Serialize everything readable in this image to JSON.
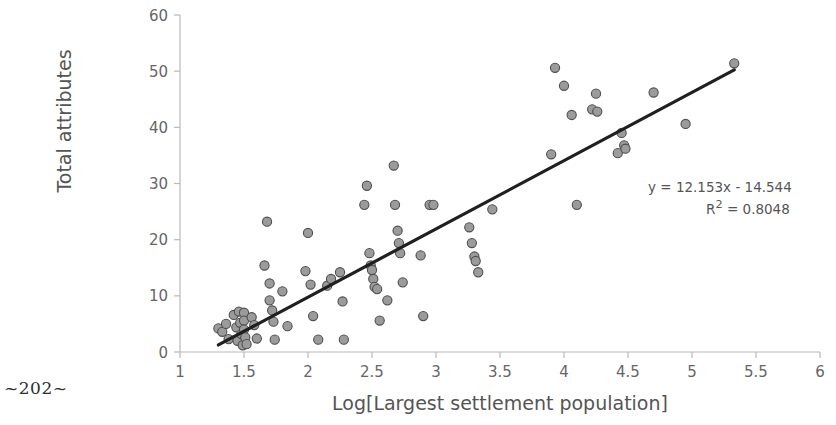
{
  "page": {
    "marker": "~202~"
  },
  "chart_data": {
    "type": "scatter",
    "title": "",
    "xlabel": "Log[Largest settlement population]",
    "ylabel": "Total attributes",
    "xlim": [
      1,
      6
    ],
    "ylim": [
      0,
      60
    ],
    "xticks": [
      1,
      1.5,
      2,
      2.5,
      3,
      3.5,
      4,
      4.5,
      5,
      5.5,
      6
    ],
    "xtick_labels": [
      "1",
      "1.5",
      "2",
      "2.5",
      "3",
      "3.5",
      "4",
      "4.5",
      "5",
      "5.5",
      "6"
    ],
    "yticks": [
      0,
      10,
      20,
      30,
      40,
      50,
      60
    ],
    "ytick_labels": [
      "0",
      "10",
      "20",
      "30",
      "40",
      "50",
      "60"
    ],
    "grid": false,
    "legend": "none",
    "marker_fill": "#9b9b9b",
    "marker_stroke": "#4f4f4f",
    "marker_radius": 4.6,
    "trendline": {
      "slope": 12.153,
      "intercept": -14.544,
      "r_squared": 0.8048,
      "color": "#1f1f1f",
      "width": 3.2,
      "x_start": 1.3,
      "x_end": 5.33,
      "equation_label": "y = 12.153x - 14.544",
      "r2_label_prefix": "R",
      "r2_label_sup": "2",
      "r2_label_rest": " = 0.8048"
    },
    "points": [
      [
        1.3,
        4.2
      ],
      [
        1.33,
        3.6
      ],
      [
        1.36,
        5.0
      ],
      [
        1.38,
        2.3
      ],
      [
        1.42,
        6.6
      ],
      [
        1.44,
        4.4
      ],
      [
        1.45,
        2.0
      ],
      [
        1.46,
        7.2
      ],
      [
        1.47,
        5.2
      ],
      [
        1.48,
        3.2
      ],
      [
        1.49,
        1.2
      ],
      [
        1.5,
        7.0
      ],
      [
        1.5,
        5.6
      ],
      [
        1.5,
        4.0
      ],
      [
        1.51,
        2.6
      ],
      [
        1.52,
        1.4
      ],
      [
        1.56,
        6.2
      ],
      [
        1.58,
        4.8
      ],
      [
        1.6,
        2.4
      ],
      [
        1.66,
        15.4
      ],
      [
        1.68,
        23.2
      ],
      [
        1.7,
        12.2
      ],
      [
        1.7,
        9.2
      ],
      [
        1.72,
        7.4
      ],
      [
        1.73,
        5.4
      ],
      [
        1.74,
        2.2
      ],
      [
        1.8,
        10.8
      ],
      [
        1.84,
        4.6
      ],
      [
        1.98,
        14.4
      ],
      [
        2.0,
        21.2
      ],
      [
        2.02,
        12.0
      ],
      [
        2.04,
        6.4
      ],
      [
        2.08,
        2.2
      ],
      [
        2.15,
        11.8
      ],
      [
        2.18,
        13.0
      ],
      [
        2.25,
        14.2
      ],
      [
        2.27,
        9.0
      ],
      [
        2.28,
        2.2
      ],
      [
        2.44,
        26.2
      ],
      [
        2.46,
        29.6
      ],
      [
        2.48,
        17.6
      ],
      [
        2.49,
        15.4
      ],
      [
        2.5,
        14.6
      ],
      [
        2.51,
        13.0
      ],
      [
        2.52,
        11.6
      ],
      [
        2.54,
        11.2
      ],
      [
        2.56,
        5.6
      ],
      [
        2.62,
        9.2
      ],
      [
        2.67,
        33.2
      ],
      [
        2.68,
        26.2
      ],
      [
        2.7,
        21.6
      ],
      [
        2.71,
        19.4
      ],
      [
        2.72,
        17.6
      ],
      [
        2.74,
        12.4
      ],
      [
        2.88,
        17.2
      ],
      [
        2.9,
        6.4
      ],
      [
        2.95,
        26.2
      ],
      [
        2.98,
        26.2
      ],
      [
        3.26,
        22.2
      ],
      [
        3.28,
        19.4
      ],
      [
        3.3,
        17.0
      ],
      [
        3.31,
        16.2
      ],
      [
        3.33,
        14.2
      ],
      [
        3.44,
        25.4
      ],
      [
        3.9,
        35.2
      ],
      [
        3.93,
        50.6
      ],
      [
        4.0,
        47.4
      ],
      [
        4.06,
        42.2
      ],
      [
        4.1,
        26.2
      ],
      [
        4.22,
        43.2
      ],
      [
        4.25,
        46.0
      ],
      [
        4.26,
        42.8
      ],
      [
        4.42,
        35.4
      ],
      [
        4.45,
        39.0
      ],
      [
        4.47,
        36.8
      ],
      [
        4.48,
        36.2
      ],
      [
        4.7,
        46.2
      ],
      [
        4.95,
        40.6
      ],
      [
        5.33,
        51.4
      ]
    ]
  }
}
